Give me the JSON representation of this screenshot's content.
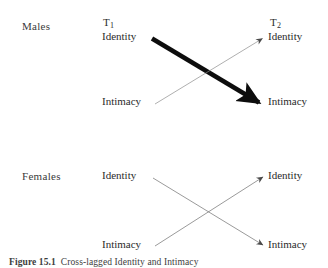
{
  "figure": {
    "caption": "Figure 15.1  Cross-lagged Identity and Intimacy",
    "caption_label": "Figure 15.1",
    "caption_text": "Cross-lagged Identity and Intimacy"
  },
  "panels": [
    {
      "id": "males",
      "group_label": "Males",
      "time_labels": {
        "t1": "T",
        "t1_sub": "1",
        "t2": "T",
        "t2_sub": "2"
      },
      "nodes": {
        "t1_top": "Identity",
        "t1_bottom": "Intimacy",
        "t2_top": "Identity",
        "t2_bottom": "Intimacy"
      },
      "paths": [
        {
          "name": "identity-to-intimacy",
          "from": "t1_top",
          "to": "t2_bottom",
          "weight": "thick",
          "stroke_width": 4.6,
          "color": "#0d0d0d"
        },
        {
          "name": "intimacy-to-identity",
          "from": "t1_bottom",
          "to": "t2_top",
          "weight": "thin",
          "stroke_width": 0.7,
          "color": "#8d8d8d"
        }
      ]
    },
    {
      "id": "females",
      "group_label": "Females",
      "nodes": {
        "t1_top": "Identity",
        "t1_bottom": "Intimacy",
        "t2_top": "Identity",
        "t2_bottom": "Intimacy"
      },
      "paths": [
        {
          "name": "identity-to-intimacy",
          "from": "t1_top",
          "to": "t2_bottom",
          "weight": "thin",
          "stroke_width": 0.7,
          "color": "#6f6f6f"
        },
        {
          "name": "intimacy-to-identity",
          "from": "t1_bottom",
          "to": "t2_top",
          "weight": "thin",
          "stroke_width": 0.7,
          "color": "#6f6f6f"
        }
      ]
    }
  ],
  "colors": {
    "background": "#ffffff",
    "text": "#2b2b2b",
    "thick_arrow": "#0d0d0d",
    "thin_arrow": "#7d7d7d"
  }
}
